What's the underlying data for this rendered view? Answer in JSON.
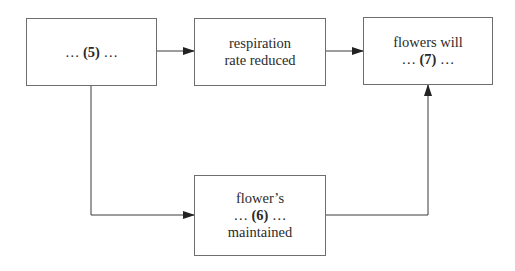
{
  "diagram": {
    "nodes": [
      {
        "id": "blank5",
        "lines": [
          {
            "pre": "… ",
            "bold": "(5)",
            "post": " …"
          }
        ]
      },
      {
        "id": "respiration",
        "lines": [
          {
            "pre": "respiration",
            "bold": "",
            "post": ""
          },
          {
            "pre": "rate reduced",
            "bold": "",
            "post": ""
          }
        ]
      },
      {
        "id": "flowers",
        "lines": [
          {
            "pre": "flowers will",
            "bold": "",
            "post": ""
          },
          {
            "pre": "… ",
            "bold": "(7)",
            "post": " …"
          }
        ]
      },
      {
        "id": "flower6",
        "lines": [
          {
            "pre": "flower’s",
            "bold": "",
            "post": ""
          },
          {
            "pre": "… ",
            "bold": "(6)",
            "post": " …"
          },
          {
            "pre": "maintained",
            "bold": "",
            "post": ""
          }
        ]
      }
    ],
    "edges": [
      {
        "from": "blank5",
        "to": "respiration"
      },
      {
        "from": "respiration",
        "to": "flowers"
      },
      {
        "from": "blank5",
        "to": "flower6"
      },
      {
        "from": "flower6",
        "to": "flowers"
      }
    ],
    "colors": {
      "line": "#3a3a3a",
      "border": "#6e6e6e",
      "text": "#2a2a2a"
    }
  }
}
